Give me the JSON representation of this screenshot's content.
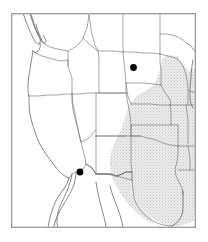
{
  "figure": {
    "width": 208,
    "height": 242,
    "background_color": "#ffffff",
    "frame": {
      "name": "map-border",
      "x": 11,
      "y": 13,
      "width": 185,
      "height": 215,
      "stroke_color": "#9a9a9a",
      "stroke_width": 1.3,
      "fill_color": "#ffffff"
    }
  },
  "style": {
    "state_border_color": "#6e6e6e",
    "coast_border_color": "#5a5a5a",
    "state_border_width": 0.6,
    "shaded_fill_color": "#e4e4e4",
    "shaded_stipple_color": "#c9c9c9",
    "unshaded_fill_color": "#ffffff",
    "marker_color": "#000000",
    "marker_radius": 3.4
  },
  "legend_note": "Shaded region indicates the highlighted range; filled circles mark two point locations.",
  "shaded_region": {
    "name": "shaded-range-region",
    "label": "Shaded distribution area (Great Plains / south-central states)",
    "fill": "#e4e4e4",
    "states_covered": [
      "Minnesota (western part)",
      "Iowa",
      "Missouri",
      "Nebraska (eastern part)",
      "Kansas (eastern part)",
      "Oklahoma",
      "Arkansas",
      "Louisiana",
      "Texas",
      "Wisconsin (western edge)",
      "Illinois (western edge)"
    ]
  },
  "markers": [
    {
      "name": "map-marker-north",
      "label": "Point locality 1",
      "region": "South Dakota",
      "x": 133.5,
      "y": 67.5,
      "color": "#000000"
    },
    {
      "name": "map-marker-south",
      "label": "Point locality 2",
      "region": "Southern Arizona / New Mexico border",
      "x": 80.0,
      "y": 172.0,
      "color": "#000000"
    }
  ],
  "map_features": {
    "states_visible": [
      "Washington",
      "Oregon",
      "California",
      "Nevada",
      "Idaho",
      "Montana",
      "Wyoming",
      "Utah",
      "Arizona",
      "Colorado",
      "New Mexico",
      "North Dakota",
      "South Dakota",
      "Nebraska",
      "Kansas",
      "Oklahoma",
      "Texas",
      "Minnesota",
      "Iowa",
      "Missouri",
      "Arkansas",
      "Louisiana",
      "Wisconsin",
      "Illinois"
    ],
    "other_features": [
      "Baja California peninsula",
      "Great Lakes (Lake Michigan, Lake Superior edge)",
      "Gulf of Mexico coastline",
      "Pacific coastline"
    ]
  }
}
